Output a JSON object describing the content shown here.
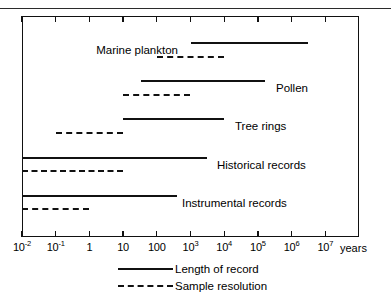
{
  "figure": {
    "axis_unit": "years",
    "x_tick_labels": [
      {
        "mantissa": "10",
        "exponent": "-2",
        "plain": null
      },
      {
        "mantissa": "10",
        "exponent": "-1",
        "plain": null
      },
      {
        "mantissa": null,
        "exponent": null,
        "plain": "1"
      },
      {
        "mantissa": null,
        "exponent": null,
        "plain": "10"
      },
      {
        "mantissa": null,
        "exponent": null,
        "plain": "100"
      },
      {
        "mantissa": "10",
        "exponent": "3",
        "plain": null
      },
      {
        "mantissa": "10",
        "exponent": "4",
        "plain": null
      },
      {
        "mantissa": "10",
        "exponent": "5",
        "plain": null
      },
      {
        "mantissa": "10",
        "exponent": "6",
        "plain": null
      },
      {
        "mantissa": "10",
        "exponent": "7",
        "plain": null
      }
    ],
    "rows": [
      {
        "label": "Marine plankton",
        "label_align": "right"
      },
      {
        "label": "Pollen",
        "label_align": "left"
      },
      {
        "label": "Tree rings",
        "label_align": "left"
      },
      {
        "label": "Historical records",
        "label_align": "left"
      },
      {
        "label": "Instrumental records",
        "label_align": "left"
      }
    ],
    "legend": [
      {
        "label": "Length of record",
        "style": "solid"
      },
      {
        "label": "Sample resolution",
        "style": "dashed"
      }
    ]
  },
  "chart_data": {
    "type": "bar",
    "chart_subtype": "horizontal-range-bar",
    "title": "",
    "xlabel": "years",
    "ylabel": "",
    "x_scale": "log10",
    "xlim": [
      0.01,
      10000000
    ],
    "x_ticks": [
      0.01,
      0.1,
      1,
      10,
      100,
      1000,
      10000,
      100000,
      1000000,
      10000000
    ],
    "x_tick_labels": [
      "10-2",
      "10-1",
      "1",
      "10",
      "100",
      "103",
      "104",
      "105",
      "106",
      "107"
    ],
    "grid": false,
    "legend_position": "bottom",
    "legend": [
      "Length of record",
      "Sample resolution"
    ],
    "categories": [
      "Marine plankton",
      "Pollen",
      "Tree rings",
      "Historical records",
      "Instrumental records"
    ],
    "series": [
      {
        "name": "Length of record",
        "style": "solid",
        "ranges": [
          {
            "category": "Marine plankton",
            "start_years": 1000,
            "end_years": 3000000
          },
          {
            "category": "Pollen",
            "start_years": 35,
            "end_years": 160000
          },
          {
            "category": "Tree rings",
            "start_years": 10,
            "end_years": 10000
          },
          {
            "category": "Historical records",
            "start_years": 0.01,
            "end_years": 3000
          },
          {
            "category": "Instrumental records",
            "start_years": 0.01,
            "end_years": 400
          }
        ]
      },
      {
        "name": "Sample resolution",
        "style": "dashed",
        "ranges": [
          {
            "category": "Marine plankton",
            "start_years": 100,
            "end_years": 10000
          },
          {
            "category": "Pollen",
            "start_years": 10,
            "end_years": 1000
          },
          {
            "category": "Tree rings",
            "start_years": 0.1,
            "end_years": 10
          },
          {
            "category": "Historical records",
            "start_years": 0.01,
            "end_years": 10
          },
          {
            "category": "Instrumental records",
            "start_years": 0.01,
            "end_years": 1
          }
        ]
      }
    ]
  },
  "geometry": {
    "plot": {
      "left": 22,
      "top": 16,
      "right": 359,
      "bottom": 237
    },
    "decade_px": 33.7,
    "x0_px": 22,
    "rows_y": [
      {
        "solid": 42,
        "dashed": 56,
        "label_y": 44,
        "label_x": 178
      },
      {
        "solid": 80,
        "dashed": 94,
        "label_y": 82,
        "label_x": 276
      },
      {
        "solid": 118,
        "dashed": 132,
        "label_y": 120,
        "label_x": 235
      },
      {
        "solid": 157,
        "dashed": 170,
        "label_y": 159,
        "label_x": 217
      },
      {
        "solid": 195,
        "dashed": 208,
        "label_y": 197,
        "label_x": 182
      }
    ]
  }
}
